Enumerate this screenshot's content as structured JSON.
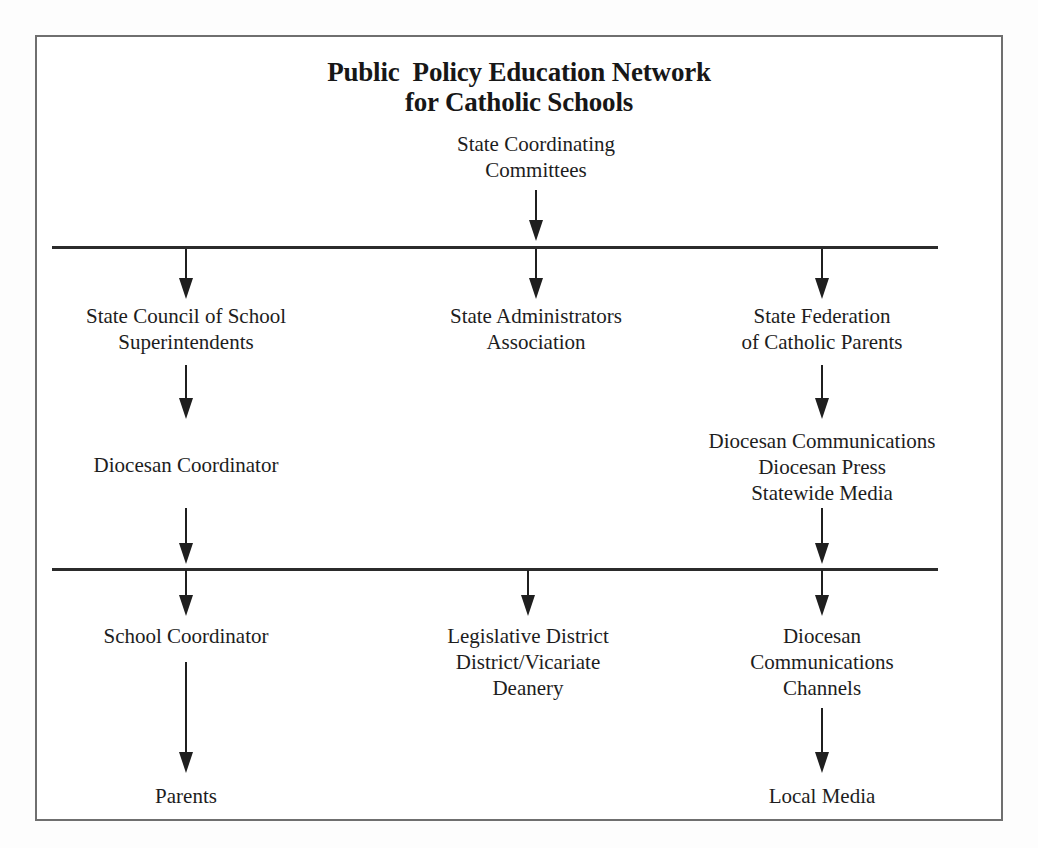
{
  "diagram": {
    "title": {
      "line1": "Public  Policy Education Network",
      "line2": "for Catholic Schools"
    },
    "nodes": {
      "state_coordinating_committees": {
        "line1": "State Coordinating",
        "line2": "Committees"
      },
      "state_council_superintendents": {
        "line1": "State Council of School",
        "line2": "Superintendents"
      },
      "state_administrators_association": {
        "line1": "State Administrators",
        "line2": "Association"
      },
      "state_federation_catholic_parents": {
        "line1": "State Federation",
        "line2": "of Catholic Parents"
      },
      "diocesan_coordinator": {
        "line1": "Diocesan Coordinator"
      },
      "diocesan_communications_group": {
        "line1": "Diocesan Communications",
        "line2": "Diocesan Press",
        "line3": "Statewide Media"
      },
      "school_coordinator": {
        "line1": "School Coordinator"
      },
      "legislative_district": {
        "line1": "Legislative District",
        "line2": "District/Vicariate",
        "line3": "Deanery"
      },
      "diocesan_communications_channels": {
        "line1": "Diocesan",
        "line2": "Communications",
        "line3": "Channels"
      },
      "parents": {
        "line1": "Parents"
      },
      "local_media": {
        "line1": "Local Media"
      }
    },
    "colors": {
      "ink": "#1d1d1d",
      "rule": "#2b2b2b",
      "frame": "#6f6f6f",
      "page": "#ffffff"
    }
  }
}
